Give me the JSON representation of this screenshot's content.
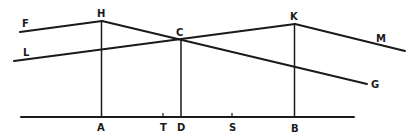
{
  "diagram": {
    "type": "geometric-construction",
    "line_color": "#1a1a1a",
    "background": "#ffffff",
    "points": {
      "F": {
        "label": "F",
        "x": 20,
        "y": 32
      },
      "H": {
        "label": "H",
        "x": 102,
        "y": 21
      },
      "L": {
        "label": "L",
        "x": 14,
        "y": 61
      },
      "C": {
        "label": "C",
        "x": 181,
        "y": 39
      },
      "K": {
        "label": "K",
        "x": 295,
        "y": 24
      },
      "M": {
        "label": "M",
        "x": 405,
        "y": 51
      },
      "G": {
        "label": "G",
        "x": 367,
        "y": 84
      },
      "A": {
        "label": "A",
        "x": 101,
        "y": 117
      },
      "T": {
        "label": "T",
        "x": 163,
        "y": 117
      },
      "D": {
        "label": "D",
        "x": 181,
        "y": 117
      },
      "S": {
        "label": "S",
        "x": 232,
        "y": 117
      },
      "B": {
        "label": "B",
        "x": 294,
        "y": 117
      }
    },
    "segments": [
      "FH",
      "HG (through C)",
      "LK (through C)",
      "KM",
      "HA",
      "CD",
      "KB",
      "baseline"
    ],
    "baseline": {
      "x1": 21,
      "x2": 354,
      "y": 117
    }
  }
}
